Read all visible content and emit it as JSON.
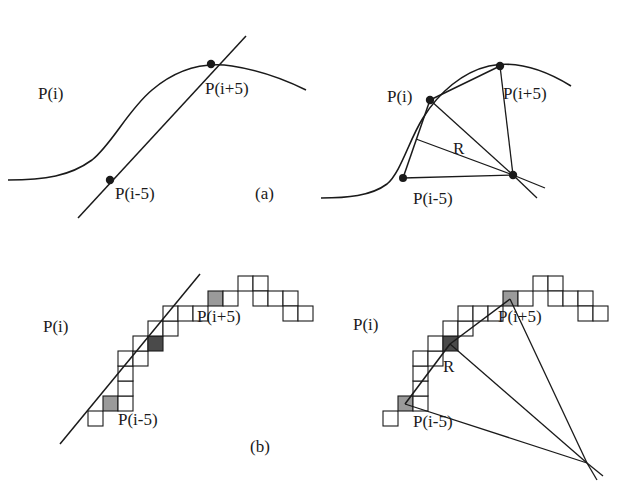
{
  "figure": {
    "caption_a": "(a)",
    "caption_b": "(b)",
    "label_pi": "P(i)",
    "label_pi_minus": "P(i-5)",
    "label_pi_plus": "P(i+5)",
    "label_r": "R"
  },
  "palette": {
    "ink": "#1a1a1a",
    "background": "#ffffff",
    "cell_fill": "#ffffff",
    "cell_dark": "#4a4a4a",
    "cell_light": "#9a9a9a"
  },
  "panels": [
    {
      "id": "panel-a-left",
      "subfigure": "a",
      "side": "left",
      "kind": "continuous-curve-with-chord",
      "labels": {
        "pi": {
          "text": "P(i)",
          "x": 38,
          "y": 85
        },
        "pi_minus": {
          "text": "P(i-5)",
          "x": 115,
          "y": 185
        },
        "pi_plus": {
          "text": "P(i+5)",
          "x": 205,
          "y": 80
        },
        "caption": {
          "text": "(a)",
          "x": 255,
          "y": 185
        }
      },
      "points": {
        "pi_minus": {
          "x": 110,
          "y": 180
        },
        "pi_plus": {
          "x": 211,
          "y": 64
        }
      },
      "curve_path": "M 8 180 C 45 180, 70 176, 92 160 C 112 144, 128 110, 152 90 C 178 68, 206 62, 232 66 C 258 70, 282 78, 306 90",
      "chord_path": "M 78 218 L 246 36"
    },
    {
      "id": "panel-a-right",
      "subfigure": "a",
      "side": "right",
      "kind": "continuous-curve-with-radius",
      "labels": {
        "pi": {
          "text": "P(i)",
          "x": 74,
          "y": 88
        },
        "pi_minus": {
          "text": "P(i-5)",
          "x": 100,
          "y": 190
        },
        "pi_plus": {
          "text": "P(i+5)",
          "x": 190,
          "y": 85
        },
        "r": {
          "text": "R",
          "x": 140,
          "y": 140
        }
      },
      "points": {
        "pi": {
          "x": 117,
          "y": 100
        },
        "pi_minus": {
          "x": 90,
          "y": 178
        },
        "pi_plus": {
          "x": 187,
          "y": 66
        },
        "center": {
          "x": 200,
          "y": 175
        }
      },
      "curve_path": "M 8 198 C 34 198, 58 196, 74 184 C 88 172, 96 140, 110 118 C 126 92, 150 72, 176 66 C 204 60, 232 70, 258 86",
      "chords": [
        "M 117 100 L 187 66",
        "M 117 100 L 90 178"
      ],
      "radii": [
        "M 117 100 L 200 175",
        "M 187 66 L 200 175",
        "M 90 178 L 200 175",
        "M 103 139 L 200 175"
      ],
      "tail_lines": [
        "M 200 175 L 232 188",
        "M 200 175 L 224 198"
      ]
    },
    {
      "id": "panel-b-left",
      "subfigure": "b",
      "side": "left",
      "kind": "discrete-chain-with-chord",
      "cell_size": 15,
      "labels": {
        "pi": {
          "text": "P(i)",
          "x": 43,
          "y": 70
        },
        "pi_minus": {
          "text": "P(i-5)",
          "x": 118,
          "y": 163
        },
        "pi_plus": {
          "text": "P(i+5)",
          "x": 197,
          "y": 60
        },
        "caption": {
          "text": "(b)",
          "x": 250,
          "y": 190
        }
      },
      "chord_path": "M 60 196 L 200 26",
      "cells": [
        {
          "x": 88,
          "y": 163,
          "shade": "outline"
        },
        {
          "x": 103,
          "y": 148,
          "shade": "light"
        },
        {
          "x": 118,
          "y": 148,
          "shade": "outline"
        },
        {
          "x": 118,
          "y": 133,
          "shade": "outline"
        },
        {
          "x": 118,
          "y": 118,
          "shade": "outline"
        },
        {
          "x": 118,
          "y": 103,
          "shade": "outline"
        },
        {
          "x": 133,
          "y": 103,
          "shade": "outline"
        },
        {
          "x": 133,
          "y": 88,
          "shade": "outline"
        },
        {
          "x": 148,
          "y": 88,
          "shade": "dark"
        },
        {
          "x": 148,
          "y": 73,
          "shade": "outline"
        },
        {
          "x": 163,
          "y": 73,
          "shade": "outline"
        },
        {
          "x": 163,
          "y": 58,
          "shade": "outline"
        },
        {
          "x": 178,
          "y": 58,
          "shade": "outline"
        },
        {
          "x": 193,
          "y": 58,
          "shade": "outline"
        },
        {
          "x": 208,
          "y": 43,
          "shade": "light"
        },
        {
          "x": 223,
          "y": 43,
          "shade": "outline"
        },
        {
          "x": 238,
          "y": 28,
          "shade": "outline"
        },
        {
          "x": 253,
          "y": 28,
          "shade": "outline"
        },
        {
          "x": 253,
          "y": 43,
          "shade": "outline"
        },
        {
          "x": 268,
          "y": 43,
          "shade": "outline"
        },
        {
          "x": 283,
          "y": 43,
          "shade": "outline"
        },
        {
          "x": 283,
          "y": 58,
          "shade": "outline"
        },
        {
          "x": 298,
          "y": 58,
          "shade": "outline"
        }
      ]
    },
    {
      "id": "panel-b-right",
      "subfigure": "b",
      "side": "right",
      "kind": "discrete-chain-with-radius",
      "cell_size": 15,
      "labels": {
        "pi": {
          "text": "P(i)",
          "x": 40,
          "y": 68
        },
        "pi_minus": {
          "text": "P(i-5)",
          "x": 100,
          "y": 165
        },
        "pi_plus": {
          "text": "P(i+5)",
          "x": 185,
          "y": 60
        },
        "r": {
          "text": "R",
          "x": 130,
          "y": 110
        }
      },
      "points": {
        "center": {
          "x": 274,
          "y": 215
        }
      },
      "cells": [
        {
          "x": 70,
          "y": 163,
          "shade": "outline"
        },
        {
          "x": 85,
          "y": 148,
          "shade": "light"
        },
        {
          "x": 100,
          "y": 148,
          "shade": "outline"
        },
        {
          "x": 100,
          "y": 133,
          "shade": "outline"
        },
        {
          "x": 100,
          "y": 118,
          "shade": "outline"
        },
        {
          "x": 100,
          "y": 103,
          "shade": "outline"
        },
        {
          "x": 115,
          "y": 103,
          "shade": "outline"
        },
        {
          "x": 115,
          "y": 88,
          "shade": "outline"
        },
        {
          "x": 130,
          "y": 88,
          "shade": "dark"
        },
        {
          "x": 130,
          "y": 73,
          "shade": "outline"
        },
        {
          "x": 145,
          "y": 73,
          "shade": "outline"
        },
        {
          "x": 145,
          "y": 58,
          "shade": "outline"
        },
        {
          "x": 160,
          "y": 58,
          "shade": "outline"
        },
        {
          "x": 175,
          "y": 58,
          "shade": "outline"
        },
        {
          "x": 190,
          "y": 43,
          "shade": "light"
        },
        {
          "x": 205,
          "y": 43,
          "shade": "outline"
        },
        {
          "x": 220,
          "y": 28,
          "shade": "outline"
        },
        {
          "x": 235,
          "y": 28,
          "shade": "outline"
        },
        {
          "x": 235,
          "y": 43,
          "shade": "outline"
        },
        {
          "x": 250,
          "y": 43,
          "shade": "outline"
        },
        {
          "x": 265,
          "y": 43,
          "shade": "outline"
        },
        {
          "x": 265,
          "y": 58,
          "shade": "outline"
        },
        {
          "x": 280,
          "y": 58,
          "shade": "outline"
        }
      ],
      "chords": [
        "M 137 96 L 197 51",
        "M 137 96 L 92 156"
      ],
      "radii": [
        "M 137 96 L 274 215",
        "M 197 51 L 274 215",
        "M 92 156 L 274 215"
      ],
      "tail_lines": [
        "M 274 215 L 290 228",
        "M 274 215 L 284 232"
      ]
    }
  ]
}
